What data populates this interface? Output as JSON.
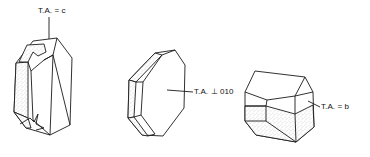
{
  "figure": {
    "type": "crystal-habit-diagram",
    "crystals": [
      {
        "id": "crystal-1",
        "label": "T.A. = c",
        "description": "Elongated prismatic crystal with stippled twin faces at top and bottom re-entrant notches"
      },
      {
        "id": "crystal-2",
        "label": "T.A. ⊥ 010",
        "description": "Tabular hexagonal-outline crystal with stippled side faces"
      },
      {
        "id": "crystal-3",
        "label": "T.A. = b",
        "description": "Equant crystal with stippled lower half (twin)"
      }
    ],
    "colors": {
      "line": "#1a1a1a",
      "background": "#ffffff",
      "stipple": "#555555"
    }
  }
}
